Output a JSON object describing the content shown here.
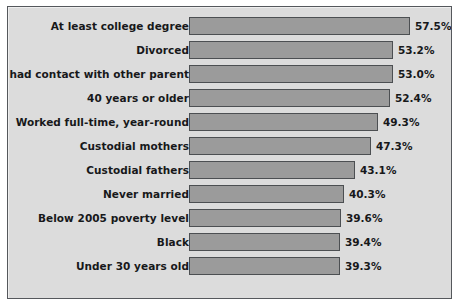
{
  "figure": {
    "background_color": "#ffffff",
    "plot_background_color": "#dcdcdc",
    "frame_color": "#55585c",
    "bar_fill_color": "#9b9b9b",
    "bar_outline_color": "#4c4f52",
    "text_color": "#17181a"
  },
  "chart_data": {
    "type": "bar",
    "orientation": "horizontal",
    "title": "",
    "subtitle": "",
    "xlabel": "",
    "ylabel": "",
    "grid": false,
    "legend": false,
    "legend_position": "none",
    "axis_baseline_percent": 0,
    "xlim": [
      0,
      57.5
    ],
    "value_suffix": "%",
    "categories": [
      "At least college degree",
      "Divorced",
      "Child had contact with other parent",
      "40 years or older",
      "Worked full-time, year-round",
      "Custodial mothers",
      "Custodial fathers",
      "Never married",
      "Below 2005 poverty level",
      "Black",
      "Under 30 years old"
    ],
    "values": [
      57.5,
      53.2,
      53.0,
      52.4,
      49.3,
      47.3,
      43.1,
      40.3,
      39.6,
      39.4,
      39.3
    ],
    "data_labels": [
      "57.5%",
      "53.2%",
      "53.0%",
      "52.4%",
      "49.3%",
      "47.3%",
      "43.1%",
      "40.3%",
      "39.6%",
      "39.4%",
      "39.3%"
    ]
  }
}
